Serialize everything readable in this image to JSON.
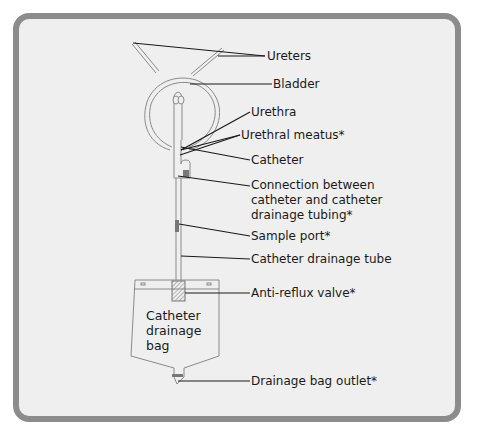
{
  "diagram": {
    "labels": {
      "ureters": "Ureters",
      "bladder": "Bladder",
      "urethra": "Urethra",
      "urethral_meatus": "Urethral meatus*",
      "catheter": "Catheter",
      "connection_line1": "Connection between",
      "connection_line2": "catheter and catheter",
      "connection_line3": "drainage tubing*",
      "sample_port": "Sample port*",
      "catheter_drainage_tube": "Catheter drainage tube",
      "anti_reflux_valve": "Anti-reflux valve*",
      "drainage_bag_outlet": "Drainage bag outlet*"
    },
    "bag_label": {
      "line1": "Catheter",
      "line2": "drainage",
      "line3": "bag"
    },
    "colors": {
      "frame_border": "#8c8c8c",
      "background": "#efefef",
      "line": "#1a1a1a",
      "outline": "#7a7a7a",
      "port_fill": "#7a7a7a"
    }
  }
}
